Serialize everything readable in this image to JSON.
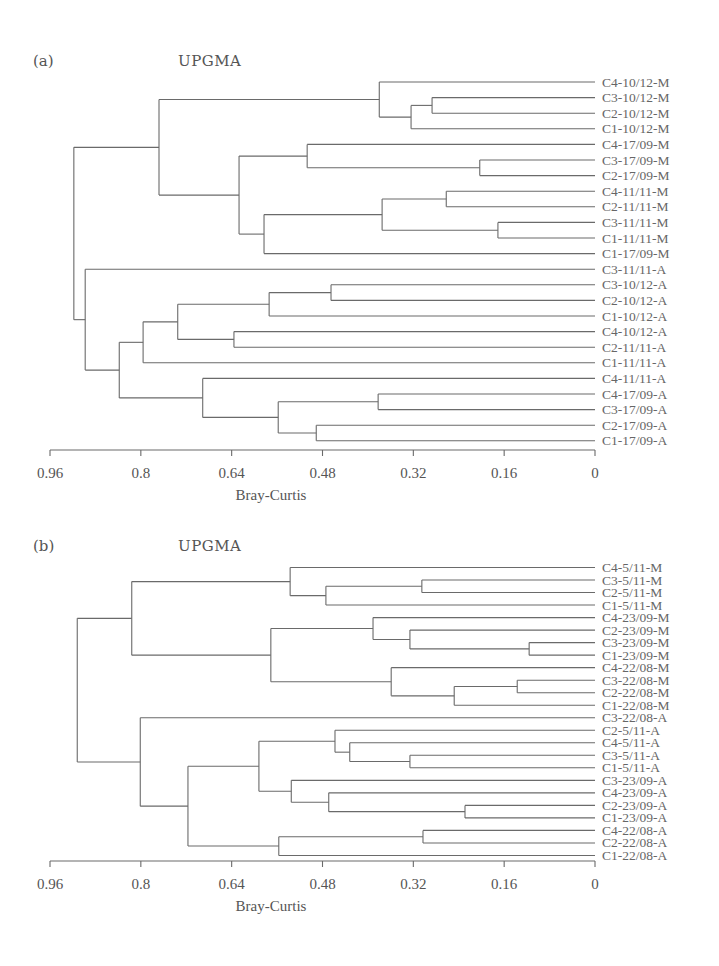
{
  "chart_data": [
    {
      "type": "dendrogram",
      "panel_label": "(a)",
      "title": "UPGMA",
      "xlabel": "Bray-Curtis",
      "ylabel": "",
      "xlim": [
        0.96,
        0
      ],
      "x_ticks": [
        0.96,
        0.8,
        0.64,
        0.48,
        0.32,
        0.16,
        0
      ],
      "x_tick_labels": [
        "0.96",
        "0.8",
        "0.64",
        "0.48",
        "0.32",
        "0.16",
        "0"
      ],
      "grid": false,
      "method": "UPGMA",
      "leaves": [
        "C4-10/12-M",
        "C3-10/12-M",
        "C2-10/12-M",
        "C1-10/12-M",
        "C4-17/09-M",
        "C3-17/09-M",
        "C2-17/09-M",
        "C4-11/11-M",
        "C2-11/11-M",
        "C3-11/11-M",
        "C1-11/11-M",
        "C1-17/09-M",
        "C3-11/11-A",
        "C3-10/12-A",
        "C2-10/12-A",
        "C1-10/12-A",
        "C4-10/12-A",
        "C2-11/11-A",
        "C1-11/11-A",
        "C4-11/11-A",
        "C4-17/09-A",
        "C3-17/09-A",
        "C2-17/09-A",
        "C1-17/09-A"
      ],
      "merges": [
        {
          "id": "a1",
          "children": [
            "C3-10/12-M",
            "C2-10/12-M"
          ],
          "height": 0.287
        },
        {
          "id": "a2",
          "children": [
            "a1",
            "C1-10/12-M"
          ],
          "height": 0.324
        },
        {
          "id": "a3",
          "children": [
            "C4-10/12-M",
            "a2"
          ],
          "height": 0.38
        },
        {
          "id": "a4",
          "children": [
            "C3-17/09-M",
            "C2-17/09-M"
          ],
          "height": 0.203
        },
        {
          "id": "a5",
          "children": [
            "C4-17/09-M",
            "a4"
          ],
          "height": 0.507
        },
        {
          "id": "a6",
          "children": [
            "C4-11/11-M",
            "C2-11/11-M"
          ],
          "height": 0.262
        },
        {
          "id": "a7",
          "children": [
            "C3-11/11-M",
            "C1-11/11-M"
          ],
          "height": 0.171
        },
        {
          "id": "a8",
          "children": [
            "a6",
            "a7"
          ],
          "height": 0.375
        },
        {
          "id": "a9",
          "children": [
            "a8",
            "C1-17/09-M"
          ],
          "height": 0.583
        },
        {
          "id": "a10",
          "children": [
            "a5",
            "a9"
          ],
          "height": 0.627
        },
        {
          "id": "a11",
          "children": [
            "a3",
            "a10"
          ],
          "height": 0.768
        },
        {
          "id": "a12",
          "children": [
            "C3-10/12-A",
            "C2-10/12-A"
          ],
          "height": 0.465
        },
        {
          "id": "a13",
          "children": [
            "a12",
            "C1-10/12-A"
          ],
          "height": 0.574
        },
        {
          "id": "a14",
          "children": [
            "C4-10/12-A",
            "C2-11/11-A"
          ],
          "height": 0.636
        },
        {
          "id": "a15",
          "children": [
            "a13",
            "a14"
          ],
          "height": 0.735
        },
        {
          "id": "a16",
          "children": [
            "a15",
            "C1-11/11-A"
          ],
          "height": 0.796
        },
        {
          "id": "a17",
          "children": [
            "C4-17/09-A",
            "C3-17/09-A"
          ],
          "height": 0.382
        },
        {
          "id": "a18",
          "children": [
            "C2-17/09-A",
            "C1-17/09-A"
          ],
          "height": 0.491
        },
        {
          "id": "a19",
          "children": [
            "a17",
            "a18"
          ],
          "height": 0.558
        },
        {
          "id": "a20",
          "children": [
            "C4-11/11-A",
            "a19"
          ],
          "height": 0.691
        },
        {
          "id": "a21",
          "children": [
            "a16",
            "a20"
          ],
          "height": 0.838
        },
        {
          "id": "a22",
          "children": [
            "C3-11/11-A",
            "a21"
          ],
          "height": 0.898
        },
        {
          "id": "a23",
          "children": [
            "a11",
            "a22"
          ],
          "height": 0.918
        }
      ]
    },
    {
      "type": "dendrogram",
      "panel_label": "(b)",
      "title": "UPGMA",
      "xlabel": "Bray-Curtis",
      "ylabel": "",
      "xlim": [
        0.96,
        0
      ],
      "x_ticks": [
        0.96,
        0.8,
        0.64,
        0.48,
        0.32,
        0.16,
        0
      ],
      "x_tick_labels": [
        "0.96",
        "0.8",
        "0.64",
        "0.48",
        "0.32",
        "0.16",
        "0"
      ],
      "grid": false,
      "method": "UPGMA",
      "leaves": [
        "C4-5/11-M",
        "C3-5/11-M",
        "C2-5/11-M",
        "C1-5/11-M",
        "C4-23/09-M",
        "C2-23/09-M",
        "C3-23/09-M",
        "C1-23/09-M",
        "C4-22/08-M",
        "C3-22/08-M",
        "C2-22/08-M",
        "C1-22/08-M",
        "C3-22/08-A",
        "C2-5/11-A",
        "C4-5/11-A",
        "C3-5/11-A",
        "C1-5/11-A",
        "C3-23/09-A",
        "C4-23/09-A",
        "C2-23/09-A",
        "C1-23/09-A",
        "C4-22/08-A",
        "C2-22/08-A",
        "C1-22/08-A"
      ],
      "merges": [
        {
          "id": "b1",
          "children": [
            "C3-5/11-M",
            "C2-5/11-M"
          ],
          "height": 0.305
        },
        {
          "id": "b2",
          "children": [
            "b1",
            "C1-5/11-M"
          ],
          "height": 0.474
        },
        {
          "id": "b3",
          "children": [
            "C4-5/11-M",
            "b2"
          ],
          "height": 0.537
        },
        {
          "id": "b4",
          "children": [
            "C3-23/09-M",
            "C1-23/09-M"
          ],
          "height": 0.116
        },
        {
          "id": "b5",
          "children": [
            "C2-23/09-M",
            "b4"
          ],
          "height": 0.326
        },
        {
          "id": "b6",
          "children": [
            "C4-23/09-M",
            "b5"
          ],
          "height": 0.391
        },
        {
          "id": "b7",
          "children": [
            "C3-22/08-M",
            "C2-22/08-M"
          ],
          "height": 0.137
        },
        {
          "id": "b8",
          "children": [
            "b7",
            "C1-22/08-M"
          ],
          "height": 0.248
        },
        {
          "id": "b9",
          "children": [
            "C4-22/08-M",
            "b8"
          ],
          "height": 0.359
        },
        {
          "id": "b10",
          "children": [
            "b6",
            "b9"
          ],
          "height": 0.571
        },
        {
          "id": "b11",
          "children": [
            "b3",
            "b10"
          ],
          "height": 0.816
        },
        {
          "id": "b12",
          "children": [
            "C3-5/11-A",
            "C1-5/11-A"
          ],
          "height": 0.326
        },
        {
          "id": "b13",
          "children": [
            "C4-5/11-A",
            "b12"
          ],
          "height": 0.432
        },
        {
          "id": "b14",
          "children": [
            "C2-5/11-A",
            "b13"
          ],
          "height": 0.458
        },
        {
          "id": "b15",
          "children": [
            "C2-23/09-A",
            "C1-23/09-A"
          ],
          "height": 0.229
        },
        {
          "id": "b16",
          "children": [
            "C4-23/09-A",
            "b15"
          ],
          "height": 0.469
        },
        {
          "id": "b17",
          "children": [
            "C3-23/09-A",
            "b16"
          ],
          "height": 0.535
        },
        {
          "id": "b18",
          "children": [
            "b14",
            "b17"
          ],
          "height": 0.592
        },
        {
          "id": "b19",
          "children": [
            "C4-22/08-A",
            "C2-22/08-A"
          ],
          "height": 0.303
        },
        {
          "id": "b20",
          "children": [
            "b19",
            "C1-22/08-A"
          ],
          "height": 0.557
        },
        {
          "id": "b21",
          "children": [
            "b18",
            "b20"
          ],
          "height": 0.717
        },
        {
          "id": "b22",
          "children": [
            "C3-22/08-A",
            "b21"
          ],
          "height": 0.801
        },
        {
          "id": "b23",
          "children": [
            "b11",
            "b22"
          ],
          "height": 0.912
        }
      ]
    }
  ],
  "panels": [
    {
      "label": "(a)",
      "title": "UPGMA",
      "axis_title": "Bray-Curtis"
    },
    {
      "label": "(b)",
      "title": "UPGMA",
      "axis_title": "Bray-Curtis"
    }
  ]
}
